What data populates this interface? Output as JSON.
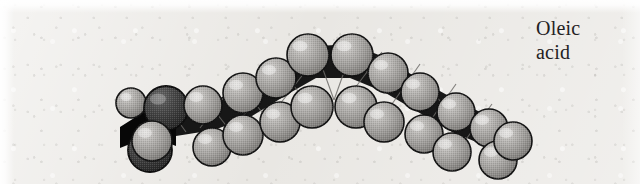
{
  "figure": {
    "width": 640,
    "height": 184,
    "background_color": "#e9e7e3",
    "paper_texture": "light grey speckled scanned paper"
  },
  "caption": {
    "line1": "Oleic",
    "line2": "acid",
    "full_text": "Oleic acid",
    "color": "#23211f",
    "font_style": "serif",
    "font_size_px": 20,
    "position": "top-right"
  },
  "model": {
    "type": "space-filling",
    "molecule": "oleic acid",
    "description": "Bent hydrocarbon chain arching upward, with a cis double bond kink at the apex; carboxyl group at the left end, terminal methyl at the right end.",
    "colors": {
      "hydrogen_sphere": "#9e9c99",
      "hydrogen_highlight": "#d2d0cd",
      "carbon_backbone": "#161616",
      "oxygen_dark_sphere": "#3a3a3a",
      "outline": "#101010",
      "bond_line": "#5d5b58"
    },
    "backbone_path": [
      {
        "x": 150,
        "y": 132
      },
      {
        "x": 176,
        "y": 124
      },
      {
        "x": 202,
        "y": 128
      },
      {
        "x": 228,
        "y": 116
      },
      {
        "x": 254,
        "y": 112
      },
      {
        "x": 278,
        "y": 98
      },
      {
        "x": 300,
        "y": 84
      },
      {
        "x": 322,
        "y": 74
      },
      {
        "x": 348,
        "y": 72
      },
      {
        "x": 372,
        "y": 80
      },
      {
        "x": 396,
        "y": 92
      },
      {
        "x": 418,
        "y": 104
      },
      {
        "x": 442,
        "y": 114
      },
      {
        "x": 466,
        "y": 124
      },
      {
        "x": 490,
        "y": 132
      },
      {
        "x": 512,
        "y": 138
      }
    ],
    "spheres": [
      {
        "cx": 131,
        "cy": 103,
        "r": 15,
        "shade": "light"
      },
      {
        "cx": 152,
        "cy": 141,
        "r": 20,
        "shade": "light"
      },
      {
        "cx": 166,
        "cy": 108,
        "r": 22,
        "shade": "dark"
      },
      {
        "cx": 150,
        "cy": 150,
        "r": 22,
        "shade": "dark"
      },
      {
        "cx": 203,
        "cy": 105,
        "r": 19,
        "shade": "light"
      },
      {
        "cx": 212,
        "cy": 147,
        "r": 19,
        "shade": "light"
      },
      {
        "cx": 243,
        "cy": 93,
        "r": 20,
        "shade": "light"
      },
      {
        "cx": 243,
        "cy": 135,
        "r": 20,
        "shade": "light"
      },
      {
        "cx": 276,
        "cy": 78,
        "r": 20,
        "shade": "light"
      },
      {
        "cx": 280,
        "cy": 122,
        "r": 20,
        "shade": "light"
      },
      {
        "cx": 308,
        "cy": 55,
        "r": 21,
        "shade": "light"
      },
      {
        "cx": 312,
        "cy": 107,
        "r": 21,
        "shade": "light"
      },
      {
        "cx": 352,
        "cy": 55,
        "r": 21,
        "shade": "light"
      },
      {
        "cx": 356,
        "cy": 107,
        "r": 21,
        "shade": "light"
      },
      {
        "cx": 388,
        "cy": 73,
        "r": 20,
        "shade": "light"
      },
      {
        "cx": 384,
        "cy": 122,
        "r": 20,
        "shade": "light"
      },
      {
        "cx": 420,
        "cy": 92,
        "r": 19,
        "shade": "light"
      },
      {
        "cx": 424,
        "cy": 134,
        "r": 19,
        "shade": "light"
      },
      {
        "cx": 456,
        "cy": 112,
        "r": 19,
        "shade": "light"
      },
      {
        "cx": 452,
        "cy": 152,
        "r": 19,
        "shade": "light"
      },
      {
        "cx": 489,
        "cy": 128,
        "r": 19,
        "shade": "light"
      },
      {
        "cx": 498,
        "cy": 160,
        "r": 19,
        "shade": "light"
      },
      {
        "cx": 511,
        "cy": 141,
        "r": 19,
        "shade": "light"
      }
    ]
  }
}
